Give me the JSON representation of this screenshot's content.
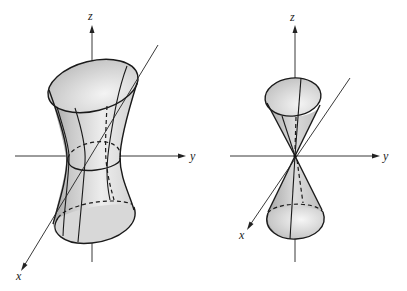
{
  "figures": [
    {
      "name": "hyperboloid-of-one-sheet",
      "axes": {
        "z_label": "z",
        "y_label": "y",
        "x_label": "x"
      }
    },
    {
      "name": "double-cone",
      "axes": {
        "z_label": "z",
        "y_label": "y",
        "x_label": "x"
      }
    }
  ],
  "colors": {
    "line": "#1a1a1a",
    "surface_light": "#f2f2f2",
    "surface_mid": "#cfcfcf",
    "surface_dark": "#a8a8a8"
  }
}
